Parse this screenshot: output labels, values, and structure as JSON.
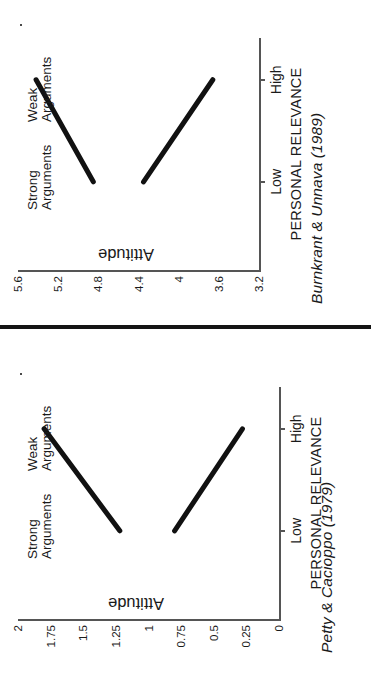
{
  "figure": {
    "divider_color": "#151515",
    "line_color": "#111111",
    "axis_color": "#555555"
  },
  "chart_data": [
    {
      "panel": "top",
      "type": "line",
      "title": "Burnkrant & Unnava (1989)",
      "xlabel": "PERSONAL RELEVANCE",
      "ylabel": "Attitude",
      "categories": [
        "Low",
        "High"
      ],
      "yticks": [
        "5.6",
        "5.2",
        "4.8",
        "4.4",
        "4",
        "3.6",
        "3.2"
      ],
      "ytick_values": [
        5.6,
        5.2,
        4.8,
        4.4,
        4,
        3.6,
        3.2
      ],
      "ylim": [
        3.2,
        5.6
      ],
      "grid": false,
      "legend": "inline-labels",
      "series": [
        {
          "name": "Strong Arguments",
          "label_lines": [
            "Strong",
            "Arguments"
          ],
          "values": [
            4.85,
            5.42
          ]
        },
        {
          "name": "Weak Arguments",
          "label_lines": [
            "Weak",
            "Arguments"
          ],
          "values": [
            4.35,
            3.66
          ]
        }
      ]
    },
    {
      "panel": "bottom",
      "type": "line",
      "title": "Petty & Cacioppo (1979)",
      "xlabel": "PERSONAL RELEVANCE",
      "ylabel": "Attitude",
      "categories": [
        "Low",
        "High"
      ],
      "yticks": [
        "2",
        "1.75",
        "1.5",
        "1.25",
        "1",
        "0.75",
        "0.5",
        "0.25",
        "0"
      ],
      "ytick_values": [
        2,
        1.75,
        1.5,
        1.25,
        1,
        0.75,
        0.5,
        0.25,
        0
      ],
      "ylim": [
        0,
        2
      ],
      "grid": false,
      "legend": "inline-labels",
      "series": [
        {
          "name": "Strong Arguments",
          "label_lines": [
            "Strong",
            "Arguments"
          ],
          "values": [
            1.22,
            1.8
          ]
        },
        {
          "name": "Weak Arguments",
          "label_lines": [
            "Weak",
            "Arguments"
          ],
          "values": [
            0.8,
            0.28
          ]
        }
      ]
    }
  ]
}
